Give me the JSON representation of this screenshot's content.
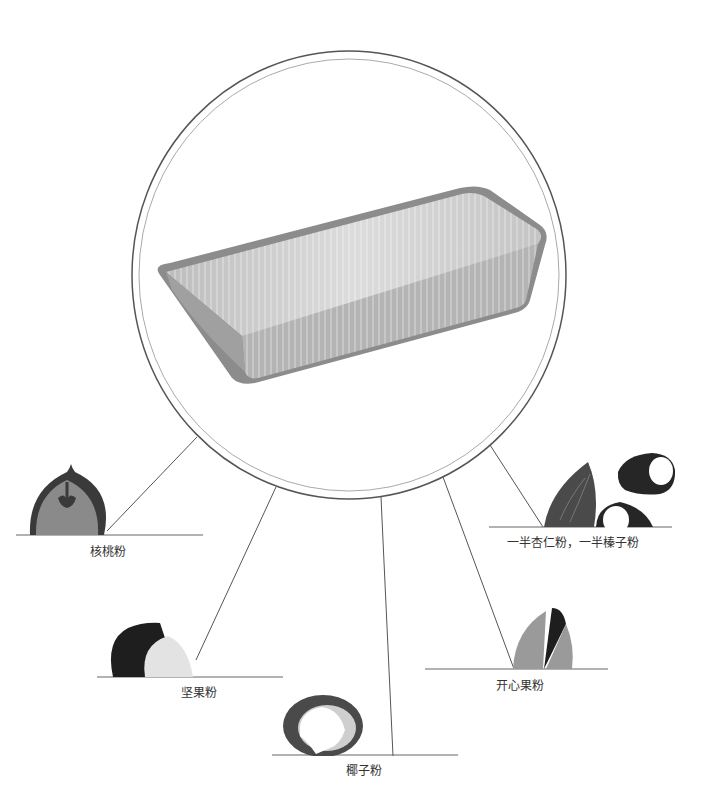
{
  "diagram": {
    "center_item": "pan",
    "center_circle": {
      "cx": 349,
      "cy": 275,
      "r": 219
    },
    "items": [
      {
        "id": "walnut",
        "label": "核桃粉",
        "label_x": 108,
        "label_y": 543
      },
      {
        "id": "mixed-nut",
        "label": "坚果粉",
        "label_x": 199,
        "label_y": 684
      },
      {
        "id": "coconut",
        "label": "椰子粉",
        "label_x": 365,
        "label_y": 762
      },
      {
        "id": "pistachio",
        "label": "开心果粉",
        "label_x": 520,
        "label_y": 677
      },
      {
        "id": "almond-hazelnut",
        "label": "一半杏仁粉，一半榛子粉",
        "label_x": 573,
        "label_y": 535
      }
    ],
    "colors": {
      "line": "#555555",
      "dark": "#3a3a3a",
      "mid": "#8a8a8a",
      "light": "#cfcfcf"
    }
  }
}
